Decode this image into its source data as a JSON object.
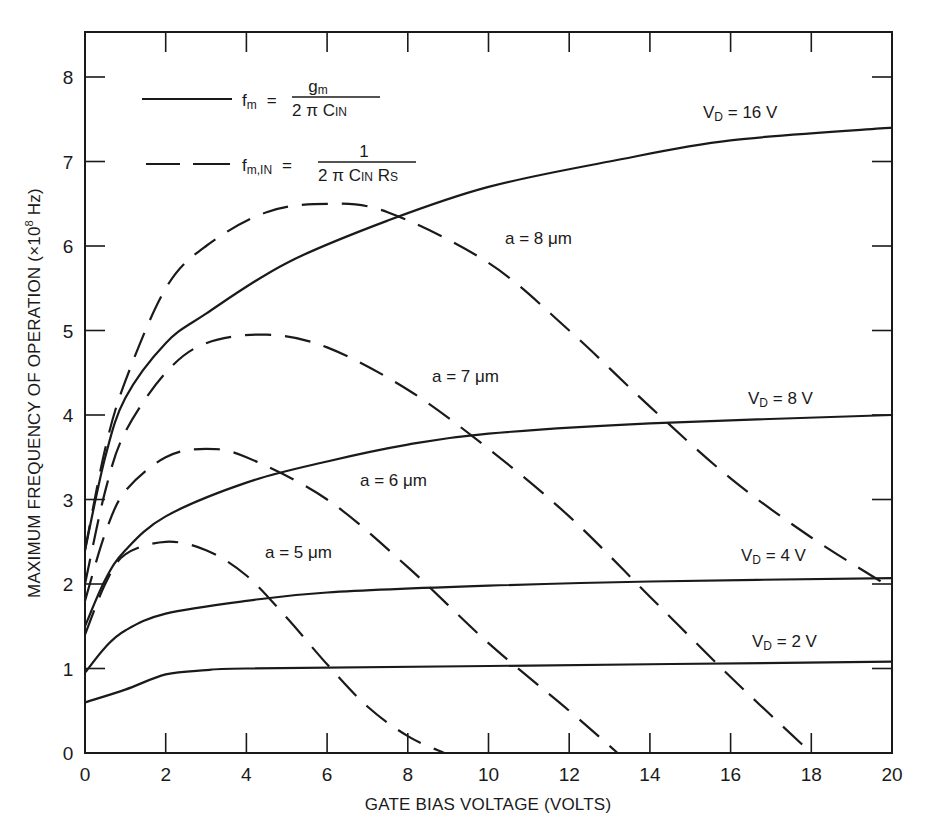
{
  "chart_data": {
    "type": "line",
    "title": "",
    "xlabel": "GATE BIAS VOLTAGE (VOLTS)",
    "ylabel": "MAXIMUM FREQUENCY OF OPERATION (×10⁸ Hz)",
    "xlim": [
      0,
      20
    ],
    "ylim": [
      0,
      8.5
    ],
    "xticks": [
      0,
      2,
      4,
      6,
      8,
      10,
      12,
      14,
      16,
      18,
      20
    ],
    "yticks": [
      0,
      1,
      2,
      3,
      4,
      5,
      6,
      7,
      8
    ],
    "grid": false,
    "legend": [
      {
        "style": "solid",
        "label": "f_m = g_m / (2 π C_IN)"
      },
      {
        "style": "dashed",
        "label": "f_m,IN = 1 / (2 π C_IN R_S)"
      }
    ],
    "legend_position": "upper left",
    "series": [
      {
        "name": "V_D = 16 V",
        "style": "solid",
        "x": [
          0,
          0.5,
          1,
          2,
          3,
          5,
          7.5,
          10,
          13,
          16,
          20
        ],
        "y": [
          2.4,
          3.5,
          4.2,
          4.85,
          5.2,
          5.8,
          6.3,
          6.7,
          7.0,
          7.25,
          7.4
        ]
      },
      {
        "name": "V_D = 8 V",
        "style": "solid",
        "x": [
          0,
          0.5,
          1,
          2,
          4,
          6,
          8,
          10,
          14,
          20
        ],
        "y": [
          1.5,
          2.05,
          2.4,
          2.8,
          3.2,
          3.45,
          3.65,
          3.78,
          3.9,
          4.0
        ]
      },
      {
        "name": "V_D = 4 V",
        "style": "solid",
        "x": [
          0,
          0.5,
          1,
          2,
          4,
          6,
          10,
          14,
          20
        ],
        "y": [
          0.95,
          1.25,
          1.45,
          1.65,
          1.8,
          1.9,
          1.98,
          2.03,
          2.07
        ]
      },
      {
        "name": "V_D = 2 V",
        "style": "solid",
        "x": [
          0,
          1,
          2,
          3,
          4,
          10,
          20
        ],
        "y": [
          0.6,
          0.75,
          0.93,
          0.98,
          1.0,
          1.03,
          1.08
        ]
      },
      {
        "name": "a = 5 μm",
        "style": "dashed",
        "x": [
          0,
          0.5,
          1,
          2,
          3,
          4,
          5,
          6,
          7,
          8,
          8.9
        ],
        "y": [
          1.4,
          2.0,
          2.35,
          2.5,
          2.4,
          2.1,
          1.6,
          1.05,
          0.55,
          0.2,
          0
        ]
      },
      {
        "name": "a = 6 μm",
        "style": "dashed",
        "x": [
          0,
          0.5,
          1,
          2,
          3,
          4,
          6,
          8,
          10,
          12,
          13.2
        ],
        "y": [
          1.8,
          2.6,
          3.1,
          3.5,
          3.6,
          3.5,
          3.0,
          2.2,
          1.3,
          0.5,
          0
        ]
      },
      {
        "name": "a = 7 μm",
        "style": "dashed",
        "x": [
          0,
          0.5,
          1,
          2,
          3,
          4.5,
          6,
          8,
          10,
          12,
          14,
          16,
          18
        ],
        "y": [
          2.0,
          3.1,
          3.8,
          4.5,
          4.85,
          4.95,
          4.8,
          4.3,
          3.6,
          2.8,
          1.85,
          0.9,
          0
        ]
      },
      {
        "name": "a = 8 μm",
        "style": "dashed",
        "x": [
          0,
          0.5,
          1,
          2,
          3,
          4.5,
          6,
          7.5,
          10,
          12,
          14,
          16,
          18,
          20
        ],
        "y": [
          2.4,
          3.6,
          4.4,
          5.5,
          6.0,
          6.4,
          6.5,
          6.4,
          5.8,
          5.0,
          4.1,
          3.25,
          2.55,
          1.95
        ]
      }
    ],
    "annotations": [
      {
        "text": "V_D = 16 V",
        "x": 15.5,
        "y": 7.65
      },
      {
        "text": "a = 8 μm",
        "x": 10.3,
        "y": 6.1
      },
      {
        "text": "a = 7 μm",
        "x": 8.4,
        "y": 4.2
      },
      {
        "text": "V_D = 8 V",
        "x": 15.7,
        "y": 4.2
      },
      {
        "text": "a = 6 μm",
        "x": 6.6,
        "y": 3.0
      },
      {
        "text": "a = 5 μm",
        "x": 3.9,
        "y": 2.15
      },
      {
        "text": "V_D = 4 V",
        "x": 15.5,
        "y": 2.1
      },
      {
        "text": "V_D = 2 V",
        "x": 15.8,
        "y": 1.15
      }
    ]
  },
  "axes": {
    "xlabel": "GATE BIAS VOLTAGE (VOLTS)",
    "ylabel_main": "MAXIMUM FREQUENCY OF OPERATION (×10",
    "ylabel_exp": "8",
    "ylabel_tail": " Hz)",
    "xticks": [
      "0",
      "2",
      "4",
      "6",
      "8",
      "10",
      "12",
      "14",
      "16",
      "18",
      "20"
    ],
    "yticks": [
      "0",
      "1",
      "2",
      "3",
      "4",
      "5",
      "6",
      "7",
      "8"
    ]
  },
  "legend": {
    "solid": {
      "lhs": "f",
      "lhs_sub": "m",
      "eq": "=",
      "num": "g",
      "num_sub": "m",
      "den": "2 π C",
      "den_sub": "IN"
    },
    "dashed": {
      "lhs": "f",
      "lhs_sub": "m,IN",
      "eq": "=",
      "num": "1",
      "den": "2 π C",
      "den_sub": "IN",
      "den2": " R",
      "den2_sub": "S"
    }
  },
  "labels": {
    "vd16": {
      "main": "V",
      "sub": "D",
      "rest": " = 16 V"
    },
    "vd8": {
      "main": "V",
      "sub": "D",
      "rest": " = 8 V"
    },
    "vd4": {
      "main": "V",
      "sub": "D",
      "rest": " = 4 V"
    },
    "vd2": {
      "main": "V",
      "sub": "D",
      "rest": " = 2 V"
    },
    "a8": "a = 8 μm",
    "a7": "a = 7 μm",
    "a6": "a = 6 μm",
    "a5": "a = 5 μm"
  }
}
